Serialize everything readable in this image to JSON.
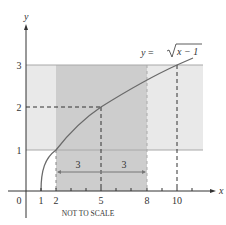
{
  "diagram": {
    "function_label_prefix": "y = ",
    "function_label_radicand": "x − 1",
    "x_axis_label": "x",
    "y_axis_label": "y",
    "note": "NOT TO SCALE",
    "x_ticks": [
      {
        "value": 0,
        "label": "0"
      },
      {
        "value": 1,
        "label": "1"
      },
      {
        "value": 2,
        "label": "2"
      },
      {
        "value": 5,
        "label": "5"
      },
      {
        "value": 8,
        "label": "8"
      },
      {
        "value": 10,
        "label": "10"
      }
    ],
    "y_ticks": [
      {
        "value": 1,
        "label": "1"
      },
      {
        "value": 2,
        "label": "2"
      },
      {
        "value": 3,
        "label": "3"
      }
    ],
    "interval_widths": [
      {
        "label": "3",
        "from": 2,
        "to": 5
      },
      {
        "label": "3",
        "from": 5,
        "to": 8
      }
    ],
    "highlighted_point": {
      "x": 5,
      "y": 2
    },
    "second_point": {
      "x": 10,
      "y": 3
    },
    "x_interval_shaded": [
      2,
      8
    ],
    "y_interval_shaded": [
      1,
      3
    ],
    "colors": {
      "dark_band": "#c9c9c9",
      "light_band": "#e8e8e8",
      "curve": "#666666",
      "axis": "#333333",
      "band_border": "#9a9a9a"
    }
  }
}
